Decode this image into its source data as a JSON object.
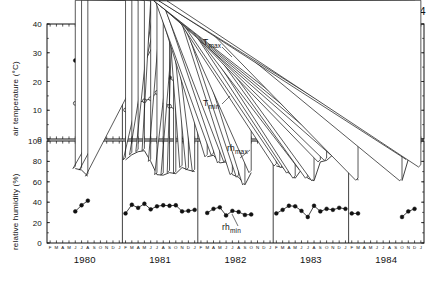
{
  "chart_data": {
    "type": "line",
    "title": "Richtersveld, 1980 - 1984",
    "xlabel": "",
    "months": [
      "F",
      "M",
      "A",
      "M",
      "J",
      "J",
      "A",
      "S",
      "O",
      "N",
      "D",
      "J"
    ],
    "years": [
      "1980",
      "1981",
      "1982",
      "1983",
      "1984"
    ],
    "panels": [
      {
        "name": "air-temperature",
        "ylabel": "air temperature (°C)",
        "ylim": [
          0,
          40
        ],
        "yticks": [
          0,
          10,
          20,
          30,
          40
        ],
        "series": [
          {
            "name": "T max",
            "label": "T",
            "sub": "max",
            "marker": "filled-circle",
            "segments": [
              {
                "year": "1980",
                "x": [
                  5,
                  6,
                  7
                ],
                "values": [
                  27.3,
                  23.8,
                  20.6
                ]
              },
              {
                "year": "1981",
                "x": [
                  1,
                  2,
                  3,
                  4,
                  5,
                  6,
                  7,
                  8,
                  9,
                  10,
                  11,
                  12
                ],
                "values": [
                  27.8,
                  24.0,
                  29.0,
                  28.8,
                  32.0,
                  30.3,
                  25.9,
                  21.4,
                  19.5,
                  19.6,
                  23.0,
                  27.6
                ]
              },
              {
                "year": "1982",
                "x": [
                  2,
                  3,
                  4,
                  5,
                  6,
                  7,
                  8
                ],
                "values": [
                  22.3,
                  25.8,
                  21.0,
                  22.8,
                  24.5,
                  26.1,
                  28.2
                ]
              },
              {
                "year": "1983",
                "x": [
                  1,
                  2,
                  3,
                  4,
                  5,
                  6,
                  7,
                  8,
                  9,
                  10,
                  11,
                  12
                ],
                "values": [
                  32.2,
                  32.5,
                  31.5,
                  23.0,
                  21.1,
                  23.8,
                  26.2,
                  23.6,
                  28.7,
                  27.9,
                  31.8,
                  31.0
                ]
              },
              {
                "year": "1983b",
                "x": [
                  13,
                  14
                ],
                "values": [
                  33.7,
                  32.3
                ]
              },
              {
                "year": "1984",
                "x": [
                  9,
                  10,
                  11
                ],
                "values": [
                  26.5,
                  25.8,
                  34.0
                ]
              }
            ]
          },
          {
            "name": "T min",
            "label": "T",
            "sub": "min",
            "marker": "open-circle",
            "segments": [
              {
                "year": "1980",
                "x": [
                  5,
                  6,
                  7
                ],
                "values": [
                  12.4,
                  11.4,
                  10.9
                ]
              },
              {
                "year": "1981",
                "x": [
                  1,
                  2,
                  3,
                  4,
                  5,
                  6,
                  7,
                  8,
                  9,
                  10,
                  11,
                  12
                ],
                "values": [
                  10.1,
                  10.5,
                  12.7,
                  13.3,
                  14.0,
                  16.2,
                  13.0,
                  11.4,
                  10.1,
                  8.7,
                  10.8,
                  14.8
                ]
              },
              {
                "year": "1982",
                "x": [
                  2,
                  3,
                  4,
                  5,
                  6,
                  7,
                  8
                ],
                "values": [
                  10.4,
                  12.0,
                  11.5,
                  12.0,
                  11.2,
                  13.2,
                  15.6
                ]
              },
              {
                "year": "1983",
                "x": [
                  1,
                  2,
                  3,
                  4,
                  5,
                  6,
                  7,
                  8,
                  9,
                  10,
                  11,
                  12
                ],
                "values": [
                  16.2,
                  17.5,
                  18.3,
                  12.3,
                  12.0,
                  12.5,
                  12.8,
                  12.1,
                  13.0,
                  14.6,
                  17.4,
                  19.6
                ]
              },
              {
                "year": "1983b",
                "x": [
                  13,
                  14
                ],
                "values": [
                  21.0,
                  21.9
                ]
              },
              {
                "year": "1984",
                "x": [
                  9,
                  10,
                  11
                ],
                "values": [
                  15.1,
                  14.6,
                  18.4
                ]
              }
            ]
          }
        ]
      },
      {
        "name": "relative-humidity",
        "ylabel": "relative humidity (%)",
        "ylim": [
          0,
          100
        ],
        "yticks": [
          0,
          20,
          40,
          60,
          80,
          100
        ],
        "series": [
          {
            "name": "rh max",
            "label": "rh",
            "sub": "max",
            "marker": "open-triangle",
            "segments": [
              {
                "year": "1980",
                "x": [
                  5,
                  6,
                  7
                ],
                "values": [
                  73.0,
                  71.5,
                  65.5
                ]
              },
              {
                "year": "1981",
                "x": [
                  1,
                  2,
                  3,
                  4,
                  5,
                  6,
                  7,
                  8,
                  9,
                  10,
                  11,
                  12
                ],
                "values": [
                  81.5,
                  86.5,
                  89.5,
                  90.5,
                  80.0,
                  67.0,
                  66.5,
                  69.0,
                  68.0,
                  74.0,
                  71.5,
                  70.0
                ]
              },
              {
                "year": "1982",
                "x": [
                  2,
                  3,
                  4,
                  5,
                  6,
                  7,
                  8,
                  9
                ],
                "values": [
                  84.5,
                  86.0,
                  78.5,
                  79.5,
                  67.0,
                  64.5,
                  57.0,
                  69.0
                ]
              },
              {
                "year": "1983",
                "x": [
                  1,
                  2,
                  3,
                  4,
                  5,
                  6,
                  7,
                  8,
                  9,
                  10,
                  11,
                  12
                ],
                "values": [
                  75.5,
                  74.0,
                  68.5,
                  63.5,
                  72.0,
                  63.5,
                  61.0,
                  79.5,
                  81.0,
                  86.5,
                  87.0,
                  87.0
                ]
              },
              {
                "year": "1983b",
                "x": [
                  13,
                  14
                ],
                "values": [
                  87.5,
                  61.5
                ]
              },
              {
                "year": "1984",
                "x": [
                  9,
                  10,
                  11
                ],
                "values": [
                  61.0,
                  82.0,
                  82.5
                ]
              },
              {
                "year": "1984b",
                "x": [
                  12
                ],
                "values": [
                  74.5
                ]
              }
            ]
          },
          {
            "name": "rh min",
            "label": "rh",
            "sub": "min",
            "marker": "filled-circle",
            "segments": [
              {
                "year": "1980",
                "x": [
                  5,
                  6,
                  7
                ],
                "values": [
                  31.0,
                  37.0,
                  41.5
                ]
              },
              {
                "year": "1981",
                "x": [
                  1,
                  2,
                  3,
                  4,
                  5,
                  6,
                  7,
                  8,
                  9,
                  10,
                  11,
                  12
                ],
                "values": [
                  29.0,
                  37.5,
                  34.5,
                  38.5,
                  33.0,
                  36.0,
                  37.0,
                  36.5,
                  37.0,
                  31.0,
                  31.5,
                  32.5
                ]
              },
              {
                "year": "1982",
                "x": [
                  2,
                  3,
                  4,
                  5,
                  6,
                  7,
                  8,
                  9
                ],
                "values": [
                  29.5,
                  33.5,
                  35.0,
                  27.0,
                  31.5,
                  30.5,
                  27.5,
                  28.0
                ]
              },
              {
                "year": "1983",
                "x": [
                  1,
                  2,
                  3,
                  4,
                  5,
                  6,
                  7,
                  8,
                  9,
                  10,
                  11,
                  12
                ],
                "values": [
                  29.0,
                  32.5,
                  36.5,
                  36.0,
                  31.5,
                  25.5,
                  36.5,
                  31.0,
                  33.5,
                  32.5,
                  34.5,
                  33.5
                ]
              },
              {
                "year": "1983b",
                "x": [
                  13,
                  14
                ],
                "values": [
                  29.0,
                  29.0
                ]
              },
              {
                "year": "1984",
                "x": [
                  9,
                  10,
                  11
                ],
                "values": [
                  25.5,
                  31.0,
                  33.5
                ]
              }
            ]
          }
        ]
      }
    ]
  }
}
